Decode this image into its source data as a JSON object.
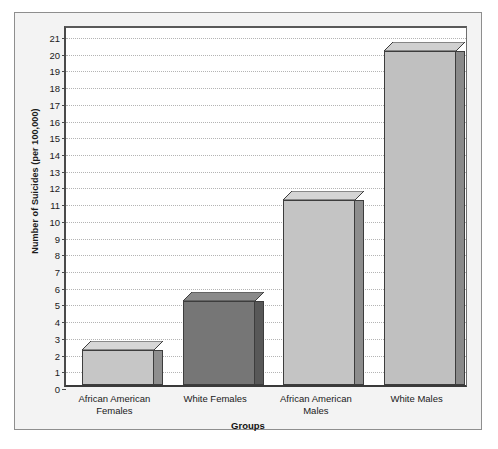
{
  "chart_data": {
    "type": "bar",
    "title": "",
    "categories": [
      "African American Females",
      "White Females",
      "African American Males",
      "White Males"
    ],
    "values": [
      2.1,
      5.0,
      11.1,
      20.0
    ],
    "series": [
      {
        "name": "Number of Suicides (per 100,000)",
        "values": [
          2.1,
          5.0,
          11.1,
          20.0
        ]
      }
    ],
    "xlabel": "Groups",
    "ylabel": "Number of Suicides (per 100,000)",
    "ylim": [
      0,
      21.6
    ],
    "ytick_values": [
      0,
      1,
      2,
      3,
      4,
      5,
      6,
      7,
      8,
      9,
      10,
      11,
      12,
      13,
      14,
      15,
      16,
      17,
      18,
      19,
      20,
      21
    ],
    "ytick_labels": [
      "0",
      "1",
      "2",
      "3",
      "4",
      "5",
      "6",
      "7",
      "8",
      "9",
      "10",
      "11",
      "12",
      "13",
      "14",
      "15",
      "16",
      "17",
      "18",
      "19",
      "20",
      "21"
    ],
    "grid": true,
    "grid_style": "dotted horizontal",
    "legend": null,
    "legend_position": "none",
    "bar_colors": [
      "#c6c6c6",
      "#767676",
      "#c4c4c4",
      "#c0c0c0"
    ],
    "bar_side_colors": [
      "#8f8f8f",
      "#585858",
      "#8d8d8d",
      "#8a8a8a"
    ],
    "bar_top_colors": [
      "#d6d6d6",
      "#8a8a8a",
      "#d4d4d4",
      "#d0d0d0"
    ],
    "style_3d": true,
    "plot_background": "#ffffff",
    "figure_background": "#f3f3f3",
    "frame_color": "#8e8e8e",
    "axis_color": "#3d3d3d",
    "text_color": "#1a1a1a"
  },
  "axes": {
    "y_title": "Number of Suicides (per 100,000)",
    "x_title": "Groups"
  },
  "categories_display": [
    {
      "line1": "African American",
      "line2": "Females"
    },
    {
      "line1": "White Females",
      "line2": ""
    },
    {
      "line1": "African American",
      "line2": "Males"
    },
    {
      "line1": "White Males",
      "line2": ""
    }
  ]
}
